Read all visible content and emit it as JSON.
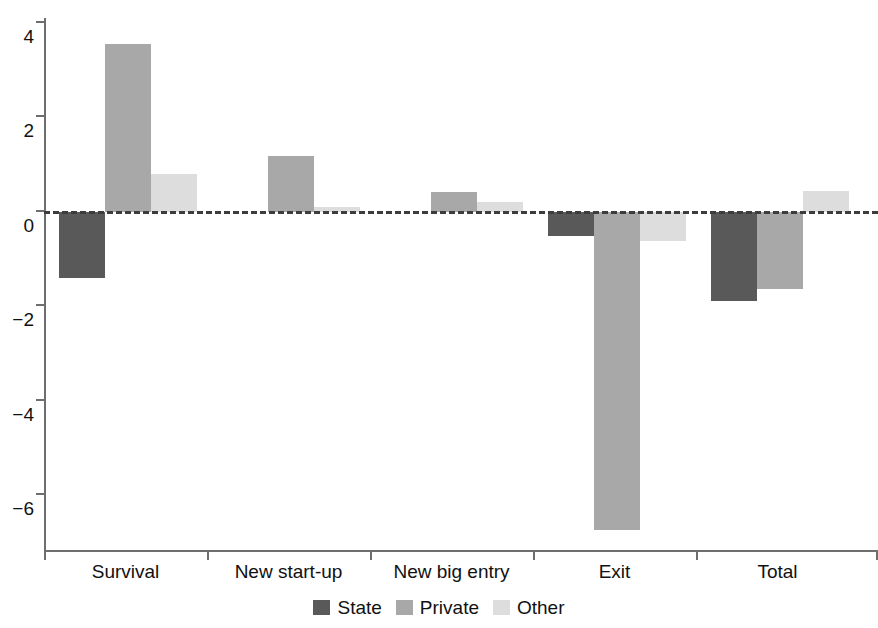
{
  "chart_data": {
    "type": "bar",
    "title": "",
    "subtitle": "",
    "xlabel": "",
    "ylabel": "",
    "categories": [
      "Survival",
      "New start-up",
      "New big entry",
      "Exit",
      "Total"
    ],
    "series": [
      {
        "name": "State",
        "color": "#595959",
        "values": [
          -1.39,
          0,
          0,
          -0.51,
          -1.88
        ]
      },
      {
        "name": "Private",
        "color": "#a8a8a8",
        "values": [
          3.55,
          1.18,
          0.42,
          -6.72,
          -1.63
        ]
      },
      {
        "name": "Other",
        "color": "#dddddd",
        "values": [
          0.8,
          0.1,
          0.21,
          -0.61,
          0.45
        ]
      }
    ],
    "ylim": [
      -6.9,
      4.0
    ],
    "yticks": [
      4,
      2,
      0,
      -2,
      -4,
      -6
    ],
    "ytick_labels": [
      "4",
      "2",
      "0",
      "−2",
      "−4",
      "−6"
    ],
    "grid": false,
    "zero_line": "dashed",
    "legend_position": "bottom",
    "legend": [
      {
        "label": "State",
        "color": "#595959"
      },
      {
        "label": "Private",
        "color": "#a8a8a8"
      },
      {
        "label": "Other",
        "color": "#dddddd"
      }
    ]
  }
}
